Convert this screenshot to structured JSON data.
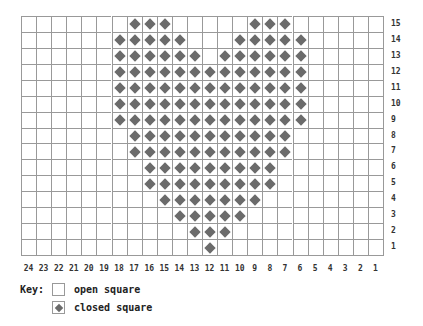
{
  "grid": {
    "columns": 24,
    "rows": 15,
    "column_labels": [
      "24",
      "23",
      "22",
      "21",
      "20",
      "19",
      "18",
      "17",
      "16",
      "15",
      "14",
      "13",
      "12",
      "11",
      "10",
      "9",
      "8",
      "7",
      "6",
      "5",
      "4",
      "3",
      "2",
      "1"
    ],
    "row_labels": [
      "15",
      "14",
      "13",
      "12",
      "11",
      "10",
      "9",
      "8",
      "7",
      "6",
      "5",
      "4",
      "3",
      "2",
      "1"
    ],
    "closed_cells_by_row": {
      "15": [
        17,
        16,
        15,
        9,
        8,
        7
      ],
      "14": [
        18,
        17,
        16,
        15,
        14,
        10,
        9,
        8,
        7,
        6
      ],
      "13": [
        18,
        17,
        16,
        15,
        14,
        13,
        11,
        10,
        9,
        8,
        7,
        6
      ],
      "12": [
        18,
        17,
        16,
        15,
        14,
        13,
        12,
        11,
        10,
        9,
        8,
        7,
        6
      ],
      "11": [
        18,
        17,
        16,
        15,
        14,
        13,
        12,
        11,
        10,
        9,
        8,
        7,
        6
      ],
      "10": [
        18,
        17,
        16,
        15,
        14,
        13,
        12,
        11,
        10,
        9,
        8,
        7,
        6
      ],
      "9": [
        18,
        17,
        16,
        15,
        14,
        13,
        12,
        11,
        10,
        9,
        8,
        7,
        6
      ],
      "8": [
        17,
        16,
        15,
        14,
        13,
        12,
        11,
        10,
        9,
        8,
        7
      ],
      "7": [
        17,
        16,
        15,
        14,
        13,
        12,
        11,
        10,
        9,
        8,
        7
      ],
      "6": [
        16,
        15,
        14,
        13,
        12,
        11,
        10,
        9,
        8
      ],
      "5": [
        16,
        15,
        14,
        13,
        12,
        11,
        10,
        9,
        8
      ],
      "4": [
        15,
        14,
        13,
        12,
        11,
        10,
        9
      ],
      "3": [
        14,
        13,
        12,
        11,
        10
      ],
      "2": [
        13,
        12,
        11
      ],
      "1": [
        12
      ]
    },
    "colors": {
      "grid_line": "#999999",
      "closed_marker": "#6b6b6b",
      "background": "#ffffff"
    }
  },
  "key": {
    "label": "Key:",
    "items": [
      {
        "symbol": "open",
        "text": "open square"
      },
      {
        "symbol": "closed",
        "text": "closed square"
      }
    ]
  }
}
